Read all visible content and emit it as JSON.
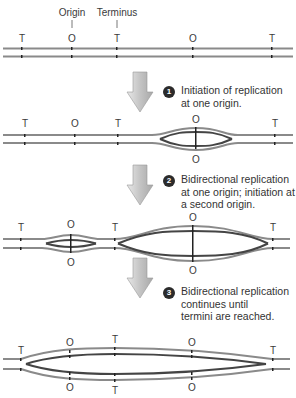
{
  "legend": {
    "origin_label": "Origin",
    "terminus_label": "Terminus"
  },
  "markers": {
    "origin": "O",
    "terminus": "T"
  },
  "colors": {
    "parental_strand": "#8a8a8a",
    "new_strand": "#444444",
    "arrow": "#c8c8c8",
    "badge": "#2b2b2b"
  },
  "steps": [
    {
      "number": "1",
      "line1": "Initiation of replication",
      "line2": "at one origin.",
      "line3": ""
    },
    {
      "number": "2",
      "line1": "Bidirectional replication",
      "line2": "at one origin; initiation at",
      "line3": "a second origin."
    },
    {
      "number": "3",
      "line1": "Bidirectional replication",
      "line2": "continues until",
      "line3": "termini are reached."
    }
  ],
  "rows": [
    {
      "stage": "initial",
      "top_labels": [
        "T",
        "O",
        "T",
        "O",
        "T"
      ],
      "bottom_labels": []
    },
    {
      "stage": "after-step-1",
      "top_labels": [
        "T",
        "O",
        "T",
        "O",
        "T"
      ],
      "bottom_labels": [
        "O"
      ]
    },
    {
      "stage": "after-step-2",
      "top_labels": [
        "T",
        "O",
        "T",
        "O",
        "T"
      ],
      "bottom_labels": [
        "O",
        "O"
      ]
    },
    {
      "stage": "after-step-3",
      "top_labels": [
        "T",
        "O",
        "T",
        "O",
        "T"
      ],
      "bottom_labels": [
        "O",
        "T",
        "O"
      ]
    }
  ]
}
